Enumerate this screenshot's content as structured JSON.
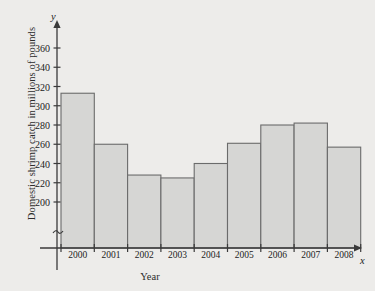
{
  "chart_data": {
    "type": "bar",
    "title": "",
    "xlabel": "Year",
    "ylabel": "Domestic shrimp catch in millions of pounds",
    "categories": [
      "2000",
      "2001",
      "2002",
      "2003",
      "2004",
      "2005",
      "2006",
      "2007",
      "2008"
    ],
    "values": [
      313,
      260,
      228,
      225,
      240,
      261,
      280,
      282,
      257
    ],
    "yticks": [
      200,
      220,
      240,
      260,
      280,
      300,
      320,
      340,
      360
    ],
    "ylim": [
      190,
      370
    ],
    "axis_break": true,
    "axis_break_symbol": "≈",
    "grid": false,
    "legend": null,
    "x_axis_variable": "x",
    "y_axis_variable": "y",
    "colors": {
      "background": "#edecea",
      "bar_fill": "#d6d6d4",
      "bar_stroke": "#6b6b6b",
      "axis": "#3a3a3a",
      "text": "#232323"
    }
  }
}
